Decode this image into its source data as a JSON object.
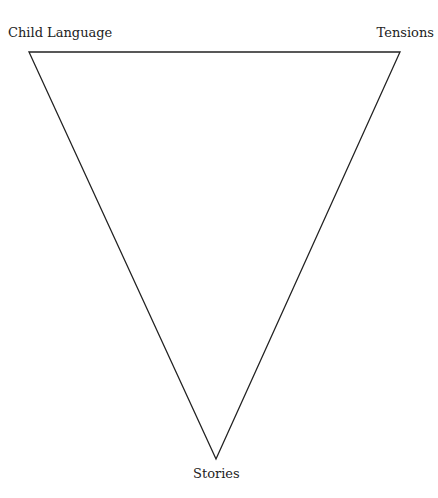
{
  "diagram": {
    "type": "inverted-triangle",
    "vertices": {
      "top_left": {
        "label": "Child Language",
        "x": 29,
        "y": 52
      },
      "top_right": {
        "label": "Tensions",
        "x": 400,
        "y": 52
      },
      "bottom": {
        "label": "Stories",
        "x": 216,
        "y": 459
      }
    },
    "stroke_color": "#222222",
    "background": "#ffffff"
  }
}
